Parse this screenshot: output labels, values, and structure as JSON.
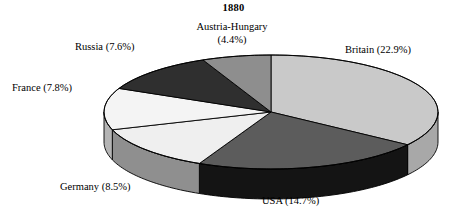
{
  "chart_data": {
    "type": "pie",
    "title": "1880",
    "subtitle": "",
    "xlabel": "",
    "ylabel": "",
    "three_d": true,
    "start_angle_deg": 0,
    "direction": "clockwise",
    "value_unit": "percent",
    "legend_position": "none",
    "labels_position": "outside",
    "grid": false,
    "categories": [
      "Britain",
      "USA",
      "Germany",
      "France",
      "Russia",
      "Austria-Hungary"
    ],
    "values": [
      22.9,
      14.7,
      8.5,
      7.8,
      7.6,
      4.4
    ],
    "total_shown": 65.9,
    "slices": [
      {
        "name": "Britain",
        "value": 22.9,
        "label": "Britain (22.9%)",
        "top_color": "#c9c9c9",
        "side_color": "#a8a8a8"
      },
      {
        "name": "USA",
        "value": 14.7,
        "label": "USA (14.7%)",
        "top_color": "#5c5c5c",
        "side_color": "#141414"
      },
      {
        "name": "Germany",
        "value": 8.5,
        "label": "Germany (8.5%)",
        "top_color": "#efefef",
        "side_color": "#8f8f8f"
      },
      {
        "name": "France",
        "value": 7.8,
        "label": "France (7.8%)",
        "top_color": "#f4f4f4",
        "side_color": "#b4b4b4"
      },
      {
        "name": "Russia",
        "value": 7.6,
        "label": "Russia (7.6%)",
        "top_color": "#2f2f2f",
        "side_color": "#1a1a1a"
      },
      {
        "name": "Austria-Hungary",
        "value": 4.4,
        "label_line1": "Austria-Hungary",
        "label_line2": "(4.4%)",
        "label": "Austria-Hungary (4.4%)",
        "top_color": "#8e8e8e",
        "side_color": "#6e6e6e"
      }
    ],
    "geometry": {
      "cx": 271,
      "cy": 112,
      "rx": 167,
      "ry": 57,
      "depth": 30,
      "stroke": "#000000",
      "stroke_width": 0.9
    },
    "background_color": "#ffffff",
    "text_color": "#000000"
  }
}
